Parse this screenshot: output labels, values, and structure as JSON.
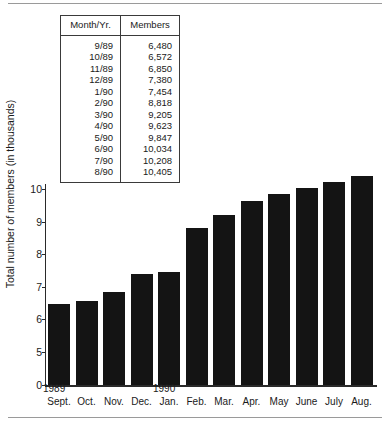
{
  "table": {
    "headers": [
      "Month/Yr.",
      "Members"
    ],
    "rows": [
      {
        "month": "9/89",
        "members": "6,480"
      },
      {
        "month": "10/89",
        "members": "6,572"
      },
      {
        "month": "11/89",
        "members": "6,850"
      },
      {
        "month": "12/89",
        "members": "7,380"
      },
      {
        "month": "1/90",
        "members": "7,454"
      },
      {
        "month": "2/90",
        "members": "8,818"
      },
      {
        "month": "3/90",
        "members": "9,205"
      },
      {
        "month": "4/90",
        "members": "9,623"
      },
      {
        "month": "5/90",
        "members": "9,847"
      },
      {
        "month": "6/90",
        "members": "10,034"
      },
      {
        "month": "7/90",
        "members": "10,208"
      },
      {
        "month": "8/90",
        "members": "10,405"
      }
    ]
  },
  "chart_data": {
    "type": "bar",
    "title": "",
    "xlabel": "",
    "ylabel": "Total number of members (in thousands)",
    "categories": [
      "Sept.",
      "Oct.",
      "Nov.",
      "Dec.",
      "Jan.",
      "Feb.",
      "Mar.",
      "Apr.",
      "May",
      "June",
      "July",
      "Aug."
    ],
    "period_labels": [
      {
        "text": "1989",
        "at_category": "Sept."
      },
      {
        "text": "1990",
        "at_category": "Jan."
      }
    ],
    "values": [
      6.48,
      6.572,
      6.85,
      7.38,
      7.454,
      8.818,
      9.205,
      9.623,
      9.847,
      10.034,
      10.208,
      10.405
    ],
    "value_labels": [
      "6,480",
      "6,572",
      "6,850",
      "7,380",
      "7,454",
      "8,818",
      "9,205",
      "9,623",
      "9,847",
      "10,034",
      "10,208",
      "10,405"
    ],
    "ytick_labels": [
      "0",
      "5",
      "6",
      "7",
      "8",
      "9",
      "10"
    ],
    "ylim": [
      5,
      10.6
    ],
    "axis_break": true,
    "grid": false,
    "legend": null,
    "bar_color": "#141414"
  }
}
